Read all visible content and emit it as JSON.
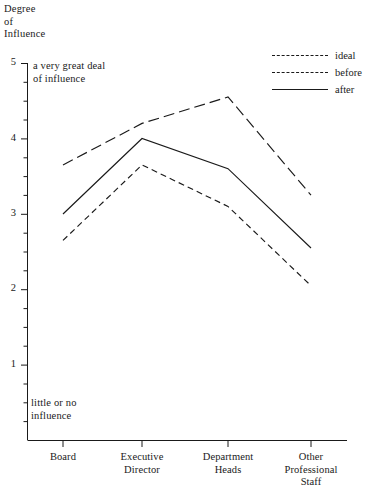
{
  "chart_data": {
    "type": "line",
    "title": "",
    "ylabel": "Degree\nof\nInfluence",
    "xlabel": "",
    "categories": [
      "Board",
      "Executive\nDirector",
      "Department\nHeads",
      "Other\nProfessional\nStaff"
    ],
    "series": [
      {
        "name": "ideal",
        "values": [
          3.65,
          4.2,
          4.55,
          3.25
        ],
        "style": "long-dash"
      },
      {
        "name": "before",
        "values": [
          2.65,
          3.65,
          3.1,
          2.05
        ],
        "style": "short-dash"
      },
      {
        "name": "after",
        "values": [
          3.0,
          4.0,
          3.6,
          2.55
        ],
        "style": "solid"
      }
    ],
    "ylim": [
      0,
      5
    ],
    "yticks": [
      0,
      1,
      2,
      3,
      4,
      5
    ],
    "ytick_labels": [
      "",
      "1",
      "2",
      "3",
      "4",
      "5"
    ],
    "minor_ticks": true,
    "grid": false,
    "legend_position": "top-right",
    "annotations": [
      {
        "name": "top-scale-anchor",
        "text": "a very great deal\nof influence"
      },
      {
        "name": "bottom-scale-anchor",
        "text": "little or no\ninfluence"
      }
    ],
    "line_color": "#1a1a1a"
  },
  "axis": {
    "y_title": "Degree\nof\nInfluence",
    "ticks": [
      {
        "value": "5"
      },
      {
        "value": "4"
      },
      {
        "value": "3"
      },
      {
        "value": "2"
      },
      {
        "value": "1"
      }
    ]
  },
  "legend": {
    "items": [
      {
        "label": "ideal"
      },
      {
        "label": "before"
      },
      {
        "label": "after"
      }
    ]
  },
  "annotations": {
    "high": "a very great deal\nof influence",
    "low": "little or no\ninfluence"
  },
  "categories": [
    {
      "label": "Board"
    },
    {
      "label": "Executive\nDirector"
    },
    {
      "label": "Department\nHeads"
    },
    {
      "label": "Other\nProfessional\nStaff"
    }
  ]
}
